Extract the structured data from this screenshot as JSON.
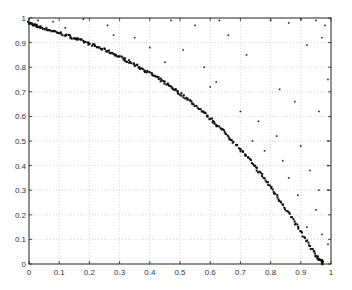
{
  "chart_data": {
    "type": "scatter",
    "title": "",
    "xlabel": "",
    "ylabel": "",
    "xlim": [
      0,
      1
    ],
    "ylim": [
      0,
      1
    ],
    "grid": true,
    "legend": null,
    "xticks": [
      "0",
      "0.1",
      "0.2",
      "0.3",
      "0.4",
      "0.5",
      "0.6",
      "0.7",
      "0.8",
      "0.9",
      "1"
    ],
    "yticks": [
      "0",
      "0.1",
      "0.2",
      "0.3",
      "0.4",
      "0.5",
      "0.6",
      "0.7",
      "0.8",
      "0.9",
      "1"
    ],
    "series": [
      {
        "name": "pareto-front",
        "description": "dense points along curved front from (0,0.98) to (0.98,0)",
        "points": [
          [
            0.0,
            0.98
          ],
          [
            0.01,
            0.975
          ],
          [
            0.02,
            0.97
          ],
          [
            0.03,
            0.965
          ],
          [
            0.05,
            0.958
          ],
          [
            0.07,
            0.95
          ],
          [
            0.09,
            0.943
          ],
          [
            0.11,
            0.935
          ],
          [
            0.13,
            0.927
          ],
          [
            0.15,
            0.918
          ],
          [
            0.17,
            0.91
          ],
          [
            0.19,
            0.9
          ],
          [
            0.21,
            0.89
          ],
          [
            0.23,
            0.88
          ],
          [
            0.25,
            0.87
          ],
          [
            0.27,
            0.86
          ],
          [
            0.29,
            0.848
          ],
          [
            0.31,
            0.836
          ],
          [
            0.33,
            0.824
          ],
          [
            0.35,
            0.81
          ],
          [
            0.37,
            0.797
          ],
          [
            0.39,
            0.783
          ],
          [
            0.41,
            0.768
          ],
          [
            0.43,
            0.752
          ],
          [
            0.45,
            0.736
          ],
          [
            0.47,
            0.72
          ],
          [
            0.49,
            0.702
          ],
          [
            0.51,
            0.684
          ],
          [
            0.53,
            0.665
          ],
          [
            0.55,
            0.645
          ],
          [
            0.57,
            0.624
          ],
          [
            0.59,
            0.602
          ],
          [
            0.61,
            0.58
          ],
          [
            0.63,
            0.556
          ],
          [
            0.65,
            0.532
          ],
          [
            0.67,
            0.506
          ],
          [
            0.69,
            0.48
          ],
          [
            0.71,
            0.452
          ],
          [
            0.73,
            0.423
          ],
          [
            0.75,
            0.393
          ],
          [
            0.77,
            0.362
          ],
          [
            0.79,
            0.33
          ],
          [
            0.81,
            0.296
          ],
          [
            0.83,
            0.261
          ],
          [
            0.85,
            0.225
          ],
          [
            0.87,
            0.188
          ],
          [
            0.89,
            0.15
          ],
          [
            0.91,
            0.11
          ],
          [
            0.93,
            0.072
          ],
          [
            0.95,
            0.035
          ],
          [
            0.96,
            0.02
          ],
          [
            0.97,
            0.01
          ],
          [
            0.975,
            0.0
          ]
        ]
      },
      {
        "name": "dominated-points",
        "description": "sparse points above/right of the front",
        "points": [
          [
            0.03,
            0.99
          ],
          [
            0.08,
            0.985
          ],
          [
            0.18,
            0.995
          ],
          [
            0.26,
            0.97
          ],
          [
            0.12,
            0.96
          ],
          [
            0.35,
            0.92
          ],
          [
            0.28,
            0.93
          ],
          [
            0.47,
            0.99
          ],
          [
            0.55,
            0.97
          ],
          [
            0.63,
            0.99
          ],
          [
            0.66,
            0.93
          ],
          [
            0.51,
            0.87
          ],
          [
            0.45,
            0.82
          ],
          [
            0.58,
            0.8
          ],
          [
            0.62,
            0.74
          ],
          [
            0.72,
            0.85
          ],
          [
            0.8,
            0.99
          ],
          [
            0.86,
            0.98
          ],
          [
            0.9,
            0.995
          ],
          [
            0.95,
            0.99
          ],
          [
            0.98,
            0.97
          ],
          [
            0.97,
            0.92
          ],
          [
            0.92,
            0.89
          ],
          [
            0.83,
            0.71
          ],
          [
            0.88,
            0.66
          ],
          [
            0.96,
            0.62
          ],
          [
            0.99,
            0.75
          ],
          [
            0.76,
            0.58
          ],
          [
            0.82,
            0.52
          ],
          [
            0.9,
            0.48
          ],
          [
            0.99,
            0.5
          ],
          [
            0.84,
            0.42
          ],
          [
            0.93,
            0.38
          ],
          [
            0.99,
            0.3
          ],
          [
            0.89,
            0.28
          ],
          [
            0.95,
            0.22
          ],
          [
            0.92,
            0.15
          ],
          [
            0.97,
            0.12
          ],
          [
            0.99,
            0.08
          ],
          [
            0.94,
            0.06
          ],
          [
            0.7,
            0.62
          ],
          [
            0.74,
            0.5
          ],
          [
            0.6,
            0.72
          ],
          [
            0.4,
            0.88
          ],
          [
            0.99,
            0.4
          ],
          [
            0.96,
            0.3
          ],
          [
            0.86,
            0.35
          ],
          [
            0.78,
            0.46
          ]
        ]
      }
    ]
  }
}
